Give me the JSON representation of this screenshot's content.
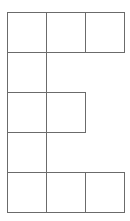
{
  "diagram": {
    "rows": 5,
    "cols": 3,
    "line_color": "#6b6b6b",
    "fill_color": "#ffffff",
    "cells": [
      {
        "row": 0,
        "col": 0
      },
      {
        "row": 0,
        "col": 1
      },
      {
        "row": 0,
        "col": 2
      },
      {
        "row": 1,
        "col": 0
      },
      {
        "row": 2,
        "col": 0
      },
      {
        "row": 2,
        "col": 1
      },
      {
        "row": 3,
        "col": 0
      },
      {
        "row": 4,
        "col": 0
      },
      {
        "row": 4,
        "col": 1
      },
      {
        "row": 4,
        "col": 2
      }
    ]
  }
}
